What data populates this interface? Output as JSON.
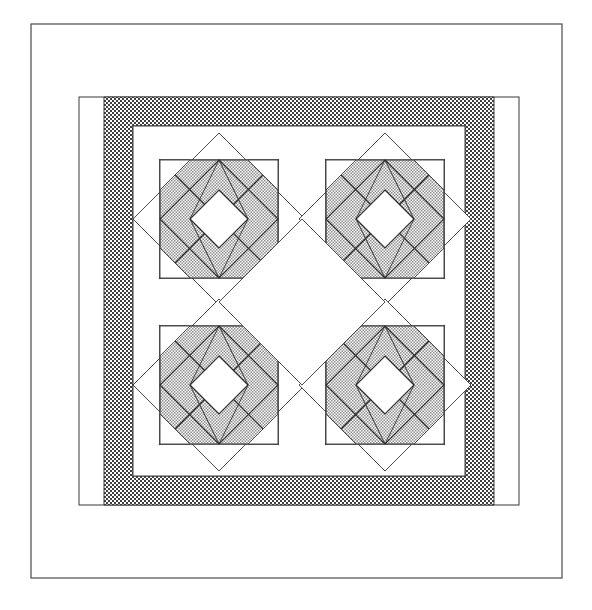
{
  "document": {
    "title": "Quilt Pattern Diagram",
    "kind": "line-art quilt block layout",
    "background_color": "#ffffff",
    "canvas": {
      "width": 592,
      "height": 610
    }
  },
  "palette": {
    "outline": "#3a3a3a",
    "line_thin": "#555555",
    "paper_white": "#ffffff",
    "shaded_fill": "#c9c9c9",
    "shaded_fill_light": "#d6d6d6",
    "border_band_fill": "#9a9a9a",
    "border_band_dark": "#4a4a4a"
  },
  "layout": {
    "outer_frame": {
      "label": "outer quilt edge",
      "x": 31,
      "y": 24,
      "width": 531,
      "height": 554,
      "stroke": "#4a4a4a",
      "fill": "#ffffff"
    },
    "inner_frame": {
      "label": "inner white margin",
      "x": 79,
      "y": 97,
      "width": 440,
      "height": 408,
      "stroke": "#4a4a4a",
      "fill": "#ffffff"
    },
    "border_band": {
      "label": "speckled sashing border",
      "outer": {
        "x": 104,
        "y": 97,
        "width": 390,
        "height": 408
      },
      "inner": {
        "x": 133,
        "y": 126,
        "width": 332,
        "height": 350
      },
      "band_width": 29,
      "texture": "checkerboard-stipple"
    },
    "field": {
      "label": "inner white quilt field",
      "x": 133,
      "y": 126,
      "width": 332,
      "height": 350,
      "fill": "#ffffff"
    }
  },
  "blocks": {
    "count": 4,
    "arrangement": "2 x 2 grid, set on point",
    "half_diagonal": 86,
    "centers": [
      {
        "name": "block-top-left",
        "cx": 219,
        "cy": 219
      },
      {
        "name": "block-top-right",
        "cx": 385,
        "cy": 219
      },
      {
        "name": "block-bottom-left",
        "cx": 219,
        "cy": 385
      },
      {
        "name": "block-bottom-right",
        "cx": 385,
        "cy": 385
      }
    ],
    "center_white_diamond": {
      "label": "central white on-point square",
      "cx": 302,
      "cy": 302,
      "half_diagonal": 83
    },
    "geometry": {
      "outer_diamond_half": 86,
      "inner_square_half": 59,
      "mid_square_half": 42,
      "center_square_half": 21
    }
  },
  "shapes": {
    "outer_diamond": "square rotated 45 degrees, unfilled",
    "inner_square": "upright square inscribed in diamond, unfilled",
    "corner_triangles": "four shaded half-square triangles pointing inward",
    "pinwheel_kites": "four shaded kite/triangle units forming pinwheel",
    "center_diamond": "small white on-point square at block center",
    "corner_squares": "four small white squares at inner square corners"
  },
  "legend": {
    "shaded": "patterned / printed fabric",
    "white": "background fabric",
    "band": "border print fabric"
  }
}
